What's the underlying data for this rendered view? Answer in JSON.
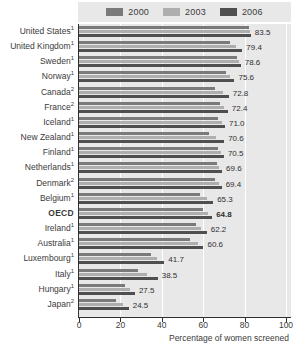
{
  "chart_data": {
    "type": "bar",
    "orientation": "horizontal",
    "title": "",
    "xlabel": "Percentage of women screened",
    "ylabel": "",
    "xlim": [
      0,
      100
    ],
    "xticks": [
      0,
      20,
      40,
      60,
      80,
      100
    ],
    "grid": true,
    "legend_position": "top",
    "legend": [
      "2000",
      "2003",
      "2006"
    ],
    "categories": [
      "United States",
      "United Kingdom",
      "Sweden",
      "Norway",
      "Canada",
      "France",
      "Iceland",
      "New Zealand",
      "Finland",
      "Netherlands",
      "Denmark",
      "Belgium",
      "OECD",
      "Ireland",
      "Australia",
      "Luxembourg",
      "Italy",
      "Hungary",
      "Japan"
    ],
    "category_footnotes": [
      "1",
      "1",
      "1",
      "1",
      "2",
      "2",
      "1",
      "1",
      "1",
      "1",
      "2",
      "1",
      "",
      "1",
      "1",
      "1",
      "1",
      "1",
      "2"
    ],
    "series": [
      {
        "name": "2000",
        "color": "#7a7a7a",
        "values": [
          82.6,
          73.6,
          76.8,
          71.4,
          66.3,
          68.5,
          67.5,
          63.2,
          67.4,
          67.1,
          66.2,
          59.0,
          60.3,
          57.0,
          54.1,
          35.2,
          28.9,
          22.8,
          18.4
        ]
      },
      {
        "name": "2003",
        "color": "#aeaeae",
        "values": [
          83.1,
          76.4,
          77.6,
          73.4,
          69.9,
          70.4,
          69.4,
          66.9,
          69.2,
          68.3,
          68.1,
          62.2,
          62.6,
          59.6,
          57.8,
          38.4,
          33.1,
          25.1,
          21.6
        ]
      },
      {
        "name": "2006",
        "color": "#4f4f4f",
        "values": [
          83.5,
          79.4,
          78.6,
          75.6,
          72.8,
          72.4,
          71.0,
          70.6,
          70.5,
          69.6,
          69.4,
          65.3,
          64.8,
          62.2,
          60.6,
          41.7,
          38.5,
          27.5,
          24.5
        ]
      }
    ],
    "value_labels": [
      "83.5",
      "79.4",
      "78.6",
      "75.6",
      "72.8",
      "72.4",
      "71.0",
      "70.6",
      "70.5",
      "69.6",
      "69.4",
      "65.3",
      "64.8",
      "62.2",
      "60.6",
      "41.7",
      "38.5",
      "27.5",
      "24.5"
    ],
    "highlighted_category": "OECD"
  },
  "colors": {
    "plot_background": "#e8e8e8",
    "grid": "#ffffff",
    "axis": "#2f2f2f",
    "series_2000": "#7a7a7a",
    "series_2003": "#aeaeae",
    "series_2006": "#4f4f4f"
  }
}
